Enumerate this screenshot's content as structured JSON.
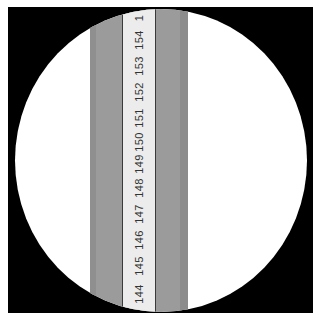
{
  "scene": {
    "description": "Measuring tape viewed through circular aperture",
    "colors": {
      "background": "#ffffff",
      "frame": "#000000",
      "aperture": "#ffffff",
      "band": "#9b9b9b",
      "tape": "#ececec",
      "text": "#333333"
    }
  },
  "tape": {
    "orientation": "vertical",
    "marks": [
      "144",
      "145",
      "146",
      "147",
      "148",
      "149",
      "150",
      "151",
      "152",
      "153",
      "154",
      "1"
    ]
  }
}
